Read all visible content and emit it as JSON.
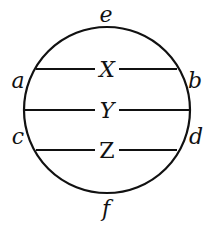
{
  "diagram": {
    "type": "circle-with-chords",
    "circle": {
      "cx": 107,
      "cy": 110,
      "r": 83
    },
    "points": [
      {
        "name": "e",
        "x": 107,
        "y": 20
      },
      {
        "name": "a",
        "x": 18,
        "y": 86
      },
      {
        "name": "b",
        "x": 195,
        "y": 86
      },
      {
        "name": "c",
        "x": 18,
        "y": 142
      },
      {
        "name": "d",
        "x": 196,
        "y": 142
      },
      {
        "name": "f",
        "x": 106,
        "y": 216
      }
    ],
    "chords": [
      {
        "label": "X",
        "y": 69,
        "x1": 36,
        "x2": 177
      },
      {
        "label": "Y",
        "y": 110,
        "x1": 24,
        "x2": 190
      },
      {
        "label": "Z",
        "y": 150,
        "x1": 36,
        "x2": 177
      }
    ],
    "stroke_color": "#111111"
  }
}
